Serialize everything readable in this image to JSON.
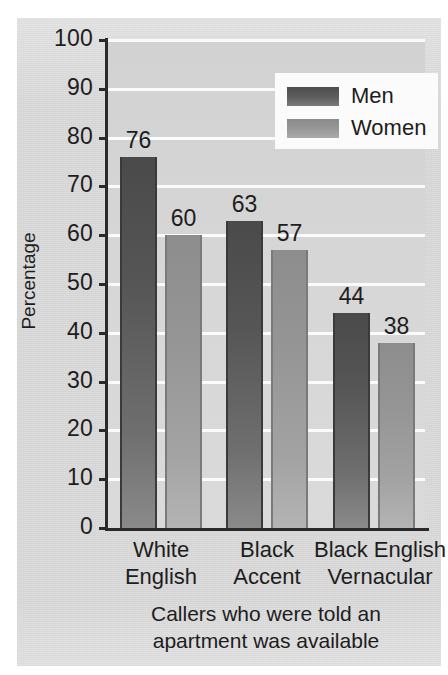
{
  "chart_data": {
    "type": "bar",
    "title": "",
    "subtitle": "",
    "xlabel": "Callers who were told an apartment was available",
    "ylabel": "Percentage",
    "ylim": [
      0,
      100
    ],
    "ytick_labels": [
      "100",
      "90",
      "80",
      "70",
      "60",
      "50",
      "40",
      "30",
      "20",
      "10",
      "0"
    ],
    "yticks": [
      100,
      90,
      80,
      70,
      60,
      50,
      40,
      30,
      20,
      10,
      0
    ],
    "grid": true,
    "grid_axis": "y",
    "legend_position": "top-right",
    "categories": [
      "White English",
      "Black Accent",
      "Black English Vernacular"
    ],
    "category_lines": [
      [
        "White",
        "English"
      ],
      [
        "Black",
        "Accent"
      ],
      [
        "Black English",
        "Vernacular"
      ]
    ],
    "series": [
      {
        "name": "Men",
        "values": [
          76,
          63,
          44
        ],
        "color": "#555555"
      },
      {
        "name": "Women",
        "values": [
          60,
          57,
          38
        ],
        "color": "#999999"
      }
    ],
    "bar_labels": [
      "76",
      "60",
      "63",
      "57",
      "44",
      "38"
    ]
  },
  "caption": {
    "line1": "Callers who were told an",
    "line2": "apartment was available"
  },
  "axis": {
    "y_title": "Percentage"
  },
  "legend": {
    "items": [
      {
        "label": "Men"
      },
      {
        "label": "Women"
      }
    ]
  },
  "colors": {
    "panel_background": "#dcdcdc",
    "plot_background": "#d4d4d4",
    "gridline": "#fbfbfb",
    "axis": "#2a2a2a",
    "men_bar": "#555555",
    "women_bar": "#999999",
    "text": "#1d1d1d",
    "legend_background": "#fbfbfb"
  }
}
